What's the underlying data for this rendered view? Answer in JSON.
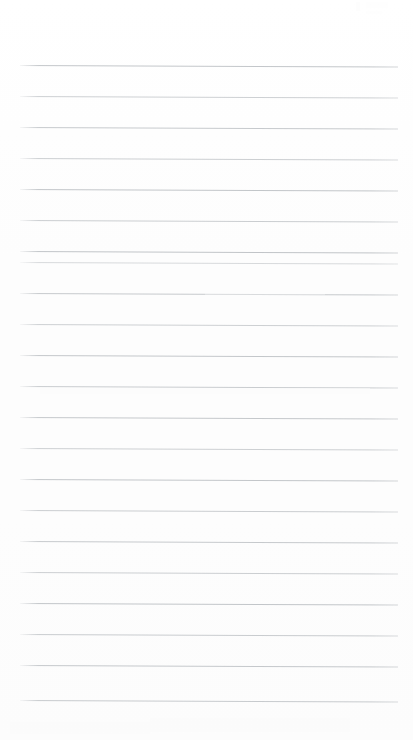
{
  "page": {
    "kind": "scanned-blank-lined-paper",
    "width": 413,
    "height": 740,
    "background_color": "#fefefe",
    "text_content": "",
    "has_handwriting": false,
    "has_printed_text": false
  },
  "ruling": {
    "line_color": "#b9bdc1",
    "line_count": 22,
    "line_thickness_px": 1,
    "line_spacing_px": 31,
    "first_line_y": 65,
    "last_line_y": 700,
    "left_margin_x": 20,
    "right_margin_x": 398,
    "skew_degrees": 0.22,
    "lines": [
      {
        "y": 65,
        "opacity": 0.85
      },
      {
        "y": 96,
        "opacity": 0.7
      },
      {
        "y": 127,
        "opacity": 0.8
      },
      {
        "y": 158,
        "opacity": 0.72
      },
      {
        "y": 189,
        "opacity": 0.86
      },
      {
        "y": 220,
        "opacity": 0.74
      },
      {
        "y": 251,
        "opacity": 0.88
      },
      {
        "y": 262,
        "opacity": 0.55
      },
      {
        "y": 293,
        "opacity": 0.8
      },
      {
        "y": 324,
        "opacity": 0.7
      },
      {
        "y": 355,
        "opacity": 0.84
      },
      {
        "y": 386,
        "opacity": 0.76
      },
      {
        "y": 417,
        "opacity": 0.82
      },
      {
        "y": 448,
        "opacity": 0.7
      },
      {
        "y": 479,
        "opacity": 0.85
      },
      {
        "y": 510,
        "opacity": 0.74
      },
      {
        "y": 541,
        "opacity": 0.8
      },
      {
        "y": 572,
        "opacity": 0.72
      },
      {
        "y": 603,
        "opacity": 0.86
      },
      {
        "y": 634,
        "opacity": 0.76
      },
      {
        "y": 665,
        "opacity": 0.82
      },
      {
        "y": 700,
        "opacity": 0.78
      }
    ]
  },
  "artifacts": {
    "smudges": [
      {
        "x": 40,
        "y": 388,
        "width": 330,
        "height": 6,
        "opacity": 0.55
      },
      {
        "x": 150,
        "y": 718,
        "width": 200,
        "height": 14,
        "opacity": 0.45
      },
      {
        "x": 10,
        "y": 722,
        "width": 140,
        "height": 12,
        "opacity": 0.4
      },
      {
        "x": 205,
        "y": 290,
        "width": 120,
        "height": 5,
        "opacity": 0.35
      }
    ],
    "corner_marks": [
      {
        "x": 356,
        "y": 2,
        "width": 4,
        "height": 9,
        "opacity": 0.5
      },
      {
        "x": 366,
        "y": 2,
        "width": 22,
        "height": 6,
        "opacity": 0.45
      },
      {
        "x": 366,
        "y": 11,
        "width": 16,
        "height": 3,
        "opacity": 0.35
      }
    ]
  }
}
